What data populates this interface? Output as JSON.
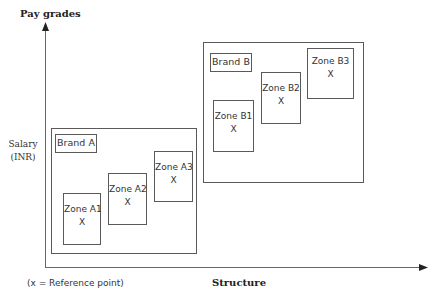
{
  "diagram": {
    "y_axis_title": "Pay grades",
    "y_axis_label_line1": "Salary",
    "y_axis_label_line2": "(INR)",
    "x_axis_title": "Structure",
    "legend_note": "(x = Reference point)",
    "brands": [
      {
        "label": "Brand A",
        "zones": [
          {
            "name": "Zone A1",
            "marker": "X"
          },
          {
            "name": "Zone A2",
            "marker": "X"
          },
          {
            "name": "Zone A3",
            "marker": "X"
          }
        ]
      },
      {
        "label": "Brand B",
        "zones": [
          {
            "name": "Zone B1",
            "marker": "X"
          },
          {
            "name": "Zone B2",
            "marker": "X"
          },
          {
            "name": "Zone B3",
            "marker": "X"
          }
        ]
      }
    ],
    "colors": {
      "line": "#5a5a5a",
      "axis": "#666666",
      "text": "#333333",
      "background": "#ffffff"
    }
  }
}
